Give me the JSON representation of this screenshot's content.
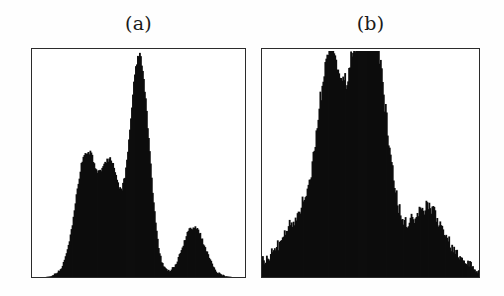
{
  "figure": {
    "background_color": "#fefefe",
    "ink_color": "#0d0d0d",
    "frame_color": "#2b2b2b"
  },
  "panels": [
    {
      "id": "a",
      "label": "(a)",
      "frame": {
        "x": 31,
        "y": 48,
        "width": 215,
        "height": 230
      }
    },
    {
      "id": "b",
      "label": "(b)",
      "frame": {
        "x": 261,
        "y": 48,
        "width": 219,
        "height": 230
      }
    }
  ],
  "chart_data": [
    {
      "type": "bar",
      "id": "panel-a-histogram",
      "title": "(a)",
      "xlabel": "",
      "ylabel": "",
      "grid": false,
      "legend": "none",
      "axis_ticks": false,
      "xlim": [
        0,
        1
      ],
      "ylim": [
        0,
        1
      ],
      "description": "Multimodal histogram with four well separated peaks; third peak is very tall and narrow.",
      "peaks": [
        {
          "name": "peak-1",
          "center": 0.255,
          "height": 0.55,
          "width": 0.052
        },
        {
          "name": "peak-2",
          "center": 0.368,
          "height": 0.445,
          "width": 0.04
        },
        {
          "name": "peak-3",
          "center": 0.502,
          "height": 0.975,
          "width": 0.046
        },
        {
          "name": "peak-4",
          "center": 0.758,
          "height": 0.225,
          "width": 0.052
        }
      ],
      "noise_amplitude": 0.018,
      "baseline": 0.0,
      "n_bins": 215,
      "categories": [
        "0.00",
        "0.05",
        "0.10",
        "0.15",
        "0.20",
        "0.25",
        "0.30",
        "0.35",
        "0.40",
        "0.45",
        "0.50",
        "0.55",
        "0.60",
        "0.65",
        "0.70",
        "0.75",
        "0.80",
        "0.85",
        "0.90",
        "0.95",
        "1.00"
      ],
      "values": [
        0.0,
        0.0,
        0.0,
        0.01,
        0.03,
        0.12,
        0.52,
        0.2,
        0.14,
        0.42,
        0.96,
        0.25,
        0.02,
        0.01,
        0.03,
        0.13,
        0.22,
        0.08,
        0.01,
        0.0,
        0.0
      ]
    },
    {
      "type": "bar",
      "id": "panel-b-histogram",
      "title": "(b)",
      "xlabel": "",
      "ylabel": "",
      "grid": false,
      "legend": "none",
      "axis_ticks": false,
      "xlim": [
        0,
        1
      ],
      "ylim": [
        0,
        1
      ],
      "description": "Broad, noisy unimodal histogram: gradual rise from the left with a shoulder, a tall sharp central peak, then a descent to a smaller secondary bump on the right.",
      "peaks": [
        {
          "name": "left-slope",
          "center": 0.33,
          "height": 0.46,
          "width": 0.17
        },
        {
          "name": "shoulder",
          "center": 0.31,
          "height": 0.52,
          "width": 0.045
        },
        {
          "name": "main-peak",
          "center": 0.492,
          "height": 0.96,
          "width": 0.072
        },
        {
          "name": "secondary-bump",
          "center": 0.752,
          "height": 0.245,
          "width": 0.07
        },
        {
          "name": "right-tail",
          "center": 0.86,
          "height": 0.08,
          "width": 0.09
        }
      ],
      "noise_amplitude": 0.05,
      "baseline": 0.0,
      "n_bins": 219,
      "categories": [
        "0.00",
        "0.05",
        "0.10",
        "0.15",
        "0.20",
        "0.25",
        "0.30",
        "0.35",
        "0.40",
        "0.45",
        "0.50",
        "0.55",
        "0.60",
        "0.65",
        "0.70",
        "0.75",
        "0.80",
        "0.85",
        "0.90",
        "0.95",
        "1.00"
      ],
      "values": [
        0.01,
        0.03,
        0.07,
        0.14,
        0.24,
        0.37,
        0.5,
        0.52,
        0.62,
        0.8,
        0.96,
        0.72,
        0.48,
        0.28,
        0.18,
        0.24,
        0.17,
        0.09,
        0.05,
        0.02,
        0.01
      ]
    }
  ]
}
